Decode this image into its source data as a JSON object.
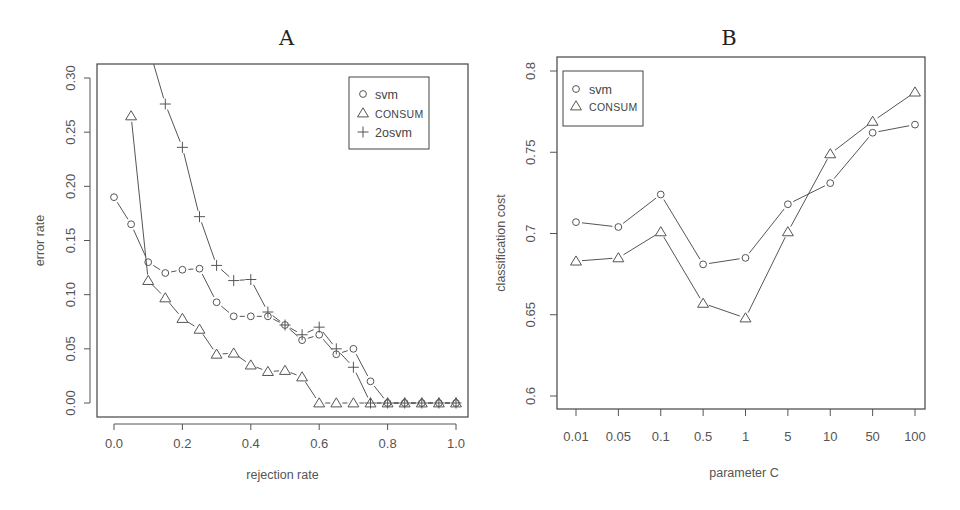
{
  "chart_data": [
    {
      "panel": "A",
      "type": "line",
      "title": "A",
      "xlabel": "rejection rate",
      "ylabel": "error rate",
      "xlim": [
        0,
        1.0
      ],
      "ylim": [
        0,
        0.3
      ],
      "xticks": [
        "0.0",
        "0.2",
        "0.4",
        "0.6",
        "0.8",
        "1.0"
      ],
      "yticks": [
        "0.00",
        "0.05",
        "0.10",
        "0.15",
        "0.20",
        "0.25",
        "0.30"
      ],
      "grid": false,
      "legend_position": "top-right",
      "series": [
        {
          "name": "svm",
          "marker": "circle",
          "x": [
            0.0,
            0.05,
            0.1,
            0.15,
            0.2,
            0.25,
            0.3,
            0.35,
            0.4,
            0.45,
            0.5,
            0.55,
            0.6,
            0.65,
            0.7,
            0.75,
            0.8,
            0.85,
            0.9,
            0.95,
            1.0
          ],
          "values": [
            0.19,
            0.165,
            0.13,
            0.12,
            0.123,
            0.124,
            0.093,
            0.08,
            0.08,
            0.08,
            0.072,
            0.058,
            0.063,
            0.045,
            0.05,
            0.02,
            0.0,
            0.0,
            0.0,
            0.0,
            0.0
          ]
        },
        {
          "name": "CONSUM",
          "marker": "triangle",
          "x": [
            0.05,
            0.1,
            0.15,
            0.2,
            0.25,
            0.3,
            0.35,
            0.4,
            0.45,
            0.5,
            0.55,
            0.6,
            0.65,
            0.7,
            0.75,
            0.8,
            0.85,
            0.9,
            0.95,
            1.0
          ],
          "values": [
            0.265,
            0.113,
            0.097,
            0.078,
            0.068,
            0.045,
            0.046,
            0.035,
            0.029,
            0.03,
            0.024,
            0.0,
            0.0,
            0.0,
            0.0,
            0.0,
            0.0,
            0.0,
            0.0,
            0.0
          ]
        },
        {
          "name": "2osvm",
          "marker": "plus",
          "x": [
            0.1,
            0.15,
            0.2,
            0.25,
            0.3,
            0.35,
            0.4,
            0.45,
            0.5,
            0.55,
            0.6,
            0.65,
            0.7,
            0.75,
            0.8,
            0.85,
            0.9,
            0.95,
            1.0
          ],
          "values": [
            0.33,
            0.276,
            0.236,
            0.172,
            0.127,
            0.113,
            0.114,
            0.084,
            0.072,
            0.063,
            0.07,
            0.05,
            0.033,
            0.0,
            0.0,
            0.0,
            0.0,
            0.0,
            0.0
          ]
        }
      ]
    },
    {
      "panel": "B",
      "type": "line",
      "title": "B",
      "xlabel": "parameter C",
      "ylabel": "classification cost",
      "categories": [
        "0.01",
        "0.05",
        "0.1",
        "0.5",
        "1",
        "5",
        "10",
        "50",
        "100"
      ],
      "ylim": [
        0.6,
        0.8
      ],
      "yticks": [
        "0.6",
        "0.65",
        "0.7",
        "0.75",
        "0.8"
      ],
      "grid": false,
      "legend_position": "top-left",
      "series": [
        {
          "name": "svm",
          "marker": "circle",
          "values": [
            0.707,
            0.704,
            0.724,
            0.681,
            0.685,
            0.718,
            0.731,
            0.762,
            0.767
          ]
        },
        {
          "name": "CONSUM",
          "marker": "triangle",
          "values": [
            0.683,
            0.685,
            0.701,
            0.657,
            0.648,
            0.701,
            0.749,
            0.769,
            0.787
          ]
        }
      ]
    }
  ]
}
